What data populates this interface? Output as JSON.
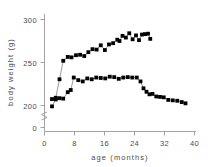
{
  "chart_data": {
    "type": "line",
    "title": "",
    "xlabel": "age (months)",
    "ylabel": "body weight (g)",
    "xlim": [
      0,
      42
    ],
    "ylim": [
      195,
      305
    ],
    "xticks": [
      0,
      8,
      16,
      24,
      32,
      40
    ],
    "xtick_labels": [
      "0",
      "8",
      "16",
      "24",
      "32",
      "40"
    ],
    "yticks": [
      200,
      250,
      300
    ],
    "ytick_labels": [
      "200",
      "250",
      "300"
    ],
    "y_axis_break": true,
    "y_origin_label": "0",
    "grid": false,
    "legend": null,
    "marker": "filled-square",
    "series": [
      {
        "name": "upper",
        "x": [
          2.0,
          3.0,
          4.0,
          5.0,
          6.2,
          7.2,
          8.4,
          9.5,
          10.6,
          11.7,
          12.8,
          13.9,
          15.0,
          16.1,
          17.2,
          18.3,
          19.4,
          20.0,
          20.8,
          21.7,
          22.6,
          23.5,
          24.4,
          25.2,
          26.0,
          26.8,
          27.6,
          28.2
        ],
        "y": [
          207.5,
          209.0,
          230.5,
          252.0,
          256.5,
          256.0,
          258.5,
          259.0,
          257.5,
          262.0,
          265.5,
          265.0,
          270.0,
          264.5,
          271.0,
          272.5,
          276.5,
          275.0,
          281.0,
          279.0,
          284.0,
          277.0,
          281.5,
          276.0,
          282.5,
          283.0,
          283.5,
          277.5
        ]
      },
      {
        "name": "lower",
        "x": [
          2.0,
          3.0,
          4.0,
          5.0,
          6.2,
          7.0,
          7.8,
          9.0,
          10.2,
          11.4,
          12.6,
          13.8,
          15.0,
          16.2,
          17.4,
          18.6,
          19.8,
          21.0,
          22.2,
          23.4,
          24.6,
          25.6,
          26.4,
          27.2,
          28.0,
          28.8,
          29.8,
          30.8,
          31.8,
          33.0,
          34.2,
          35.4,
          36.6,
          37.6
        ],
        "y": [
          199.0,
          207.0,
          208.5,
          208.0,
          215.5,
          218.0,
          232.5,
          229.5,
          228.0,
          231.5,
          230.5,
          232.5,
          232.0,
          231.5,
          233.5,
          233.0,
          231.0,
          232.5,
          233.0,
          232.5,
          232.5,
          228.0,
          220.0,
          216.0,
          213.0,
          213.5,
          210.5,
          210.0,
          209.5,
          206.5,
          206.0,
          205.5,
          204.0,
          202.5
        ]
      }
    ]
  }
}
